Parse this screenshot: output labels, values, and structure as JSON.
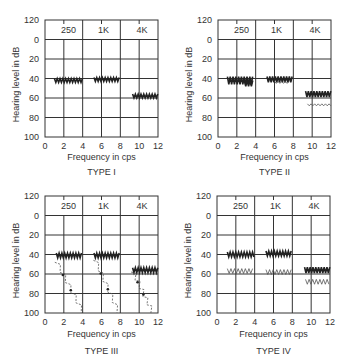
{
  "figure": {
    "background": "#ffffff",
    "grid_color": "#333333",
    "trace_color": "#222222",
    "faint_trace_color": "#555555"
  },
  "chart_data": [
    {
      "type": "line",
      "title": "TYPE I",
      "xlabel": "Frequency in cps",
      "ylabel": "Hearing level in dB",
      "xlim": [
        0,
        12
      ],
      "ylim": [
        120,
        100
      ],
      "y_inverted": true,
      "xticks": [
        0,
        2,
        4,
        6,
        8,
        10,
        12
      ],
      "yticks": [
        120,
        0,
        20,
        40,
        60,
        80,
        100
      ],
      "grid": true,
      "band_labels": [
        {
          "text": "250",
          "x": 2.5
        },
        {
          "text": "1K",
          "x": 6.2
        },
        {
          "text": "4K",
          "x": 10.3
        }
      ],
      "series": [
        {
          "name": "250 continuous",
          "style": "zigzag",
          "x_range": [
            1.0,
            4.0
          ],
          "level": 42,
          "amplitude": 2
        },
        {
          "name": "1K continuous",
          "style": "zigzag",
          "x_range": [
            5.2,
            8.0
          ],
          "level": 41,
          "amplitude": 2
        },
        {
          "name": "4K continuous",
          "style": "zigzag",
          "x_range": [
            9.3,
            12.0
          ],
          "level": 58,
          "amplitude": 2
        }
      ]
    },
    {
      "type": "line",
      "title": "TYPE II",
      "xlabel": "Frequency in cps",
      "ylabel": "Hearing level in dB",
      "xlim": [
        0,
        12
      ],
      "ylim": [
        120,
        100
      ],
      "y_inverted": true,
      "xticks": [
        0,
        2,
        4,
        6,
        8,
        10,
        12
      ],
      "yticks": [
        120,
        0,
        20,
        40,
        60,
        80,
        100
      ],
      "grid": true,
      "band_labels": [
        {
          "text": "250",
          "x": 2.5
        },
        {
          "text": "1K",
          "x": 6.2
        },
        {
          "text": "4K",
          "x": 10.3
        }
      ],
      "series": [
        {
          "name": "250 continuous",
          "style": "zigzag",
          "x_range": [
            1.0,
            3.8
          ],
          "level": 42,
          "amplitude": 4
        },
        {
          "name": "250 pulsed",
          "style": "zigzag",
          "x_range": [
            2.8,
            3.8
          ],
          "level": 45,
          "amplitude": 3
        },
        {
          "name": "1K continuous",
          "style": "zigzag",
          "x_range": [
            5.2,
            8.0
          ],
          "level": 41,
          "amplitude": 3
        },
        {
          "name": "1K pulsed",
          "style": "faint",
          "x_range": [
            6.0,
            7.6
          ],
          "level": 44,
          "amplitude": 1
        },
        {
          "name": "4K continuous",
          "style": "zigzag",
          "x_range": [
            9.3,
            12.0
          ],
          "level": 56,
          "amplitude": 3
        },
        {
          "name": "4K pulsed",
          "style": "faint",
          "x_range": [
            9.5,
            12.0
          ],
          "level": 67,
          "amplitude": 1
        }
      ]
    },
    {
      "type": "line",
      "title": "TYPE III",
      "xlabel": "Frequency in cps",
      "ylabel": "Hearing level in dB",
      "xlim": [
        0,
        12
      ],
      "ylim": [
        120,
        100
      ],
      "y_inverted": true,
      "xticks": [
        0,
        2,
        4,
        6,
        8,
        10,
        12
      ],
      "yticks": [
        120,
        0,
        20,
        40,
        60,
        80,
        100
      ],
      "grid": true,
      "band_labels": [
        {
          "text": "250",
          "x": 2.5
        },
        {
          "text": "1K",
          "x": 6.2
        },
        {
          "text": "4K",
          "x": 10.3
        }
      ],
      "series": [
        {
          "name": "250 continuous",
          "style": "zigzag",
          "x_range": [
            1.2,
            4.0
          ],
          "level": 41,
          "amplitude": 2.5
        },
        {
          "name": "250 pulsed decay",
          "style": "decay",
          "x_range": [
            1.2,
            4.0
          ],
          "y_range": [
            48,
            100
          ]
        },
        {
          "name": "1K continuous",
          "style": "zigzag",
          "x_range": [
            5.2,
            8.0
          ],
          "level": 41,
          "amplitude": 2.5
        },
        {
          "name": "1K pulsed decay",
          "style": "decay",
          "x_range": [
            5.3,
            7.8
          ],
          "y_range": [
            46,
            100
          ]
        },
        {
          "name": "4K continuous",
          "style": "zigzag",
          "x_range": [
            9.3,
            12.0
          ],
          "level": 56,
          "amplitude": 2.5
        },
        {
          "name": "4K pulsed decay",
          "style": "decay",
          "x_range": [
            9.3,
            11.4
          ],
          "y_range": [
            58,
            100
          ]
        }
      ]
    },
    {
      "type": "line",
      "title": "TYPE IV",
      "xlabel": "Frequency in cps",
      "ylabel": "Hearing level in dB",
      "xlim": [
        0,
        12
      ],
      "ylim": [
        120,
        100
      ],
      "y_inverted": true,
      "xticks": [
        0,
        2,
        4,
        6,
        8,
        10,
        12
      ],
      "yticks": [
        120,
        0,
        20,
        40,
        60,
        80,
        100
      ],
      "grid": true,
      "band_labels": [
        {
          "text": "250",
          "x": 2.5
        },
        {
          "text": "1K",
          "x": 6.2
        },
        {
          "text": "4K",
          "x": 10.3
        }
      ],
      "series": [
        {
          "name": "250 continuous",
          "style": "zigzag",
          "x_range": [
            1.1,
            4.0
          ],
          "level": 40,
          "amplitude": 2.5
        },
        {
          "name": "250 pulsed",
          "style": "faint",
          "x_range": [
            1.1,
            3.9
          ],
          "level": 57,
          "amplitude": 2.5
        },
        {
          "name": "1K continuous",
          "style": "zigzag",
          "x_range": [
            5.2,
            7.9
          ],
          "level": 39,
          "amplitude": 2.5
        },
        {
          "name": "1K pulsed",
          "style": "faint",
          "x_range": [
            5.2,
            7.9
          ],
          "level": 58,
          "amplitude": 2.5
        },
        {
          "name": "4K continuous",
          "style": "zigzag",
          "x_range": [
            9.3,
            12.0
          ],
          "level": 56,
          "amplitude": 3
        },
        {
          "name": "4K pulsed",
          "style": "faint",
          "x_range": [
            9.4,
            12.0
          ],
          "level": 68,
          "amplitude": 2.5
        }
      ]
    }
  ],
  "layout": {
    "panels": [
      {
        "left": 45,
        "top": 20,
        "right": 158,
        "bottom": 137,
        "xlabel_y": 160,
        "title_y": 175
      },
      {
        "left": 218,
        "top": 20,
        "right": 331,
        "bottom": 137,
        "xlabel_y": 160,
        "title_y": 175
      },
      {
        "left": 45,
        "top": 196,
        "right": 158,
        "bottom": 313,
        "xlabel_y": 337,
        "title_y": 354
      },
      {
        "left": 217,
        "top": 196,
        "right": 330,
        "bottom": 313,
        "xlabel_y": 337,
        "title_y": 354
      }
    ]
  }
}
